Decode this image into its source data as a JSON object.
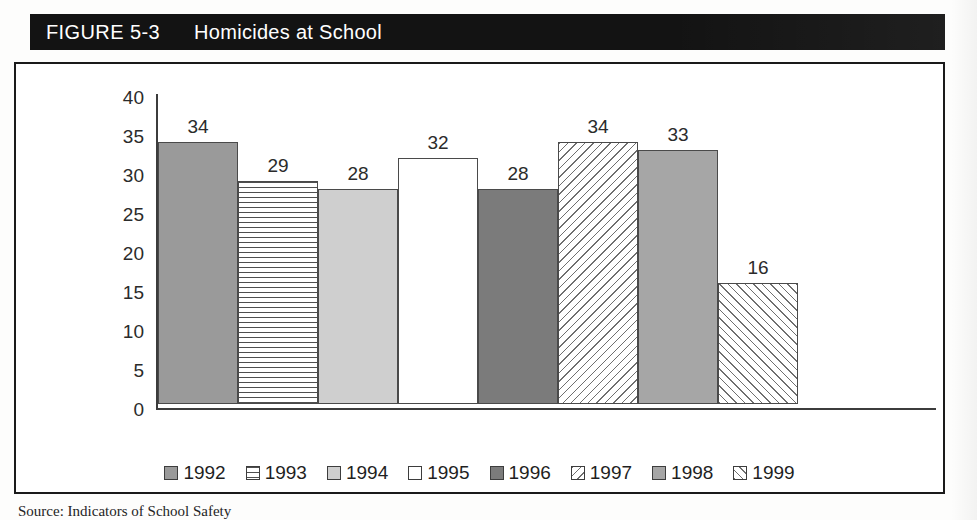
{
  "figure": {
    "number_label": "FIGURE 5-3",
    "title": "Homicides at School"
  },
  "source_note": "Source: Indicators of School Safety",
  "chart_data": {
    "type": "bar",
    "title": "Homicides at School",
    "xlabel": "",
    "ylabel": "",
    "ylim": [
      0,
      40
    ],
    "ytick_step": 5,
    "grid": false,
    "legend_position": "bottom",
    "categories": [
      "1992",
      "1993",
      "1994",
      "1995",
      "1996",
      "1997",
      "1998",
      "1999"
    ],
    "values": [
      34,
      29,
      28,
      32,
      28,
      34,
      33,
      16
    ],
    "value_labels": [
      "34",
      "29",
      "28",
      "32",
      "28",
      "34",
      "33",
      "16"
    ],
    "yticks": [
      "40",
      "35",
      "30",
      "25",
      "20",
      "15",
      "10",
      "5",
      "0"
    ],
    "bar_patterns": [
      "solid-medium-gray",
      "horizontal-lines",
      "solid-light-gray",
      "white",
      "solid-dark-gray",
      "diagonal-hatch-back",
      "solid-medium-gray",
      "diagonal-hatch-forward"
    ],
    "legend": [
      {
        "label": "1992",
        "pattern": "solid-medium-gray"
      },
      {
        "label": "1993",
        "pattern": "horizontal-lines"
      },
      {
        "label": "1994",
        "pattern": "solid-light-gray"
      },
      {
        "label": "1995",
        "pattern": "white"
      },
      {
        "label": "1996",
        "pattern": "solid-dark-gray"
      },
      {
        "label": "1997",
        "pattern": "diagonal-hatch-back"
      },
      {
        "label": "1998",
        "pattern": "solid-medium-gray"
      },
      {
        "label": "1999",
        "pattern": "diagonal-hatch-forward"
      }
    ],
    "colors": {
      "banner_background": "#131313",
      "banner_text": "#ffffff",
      "axis": "#3c3c3c",
      "frame": "#1a1a1a",
      "text": "#2b2b2b"
    }
  }
}
